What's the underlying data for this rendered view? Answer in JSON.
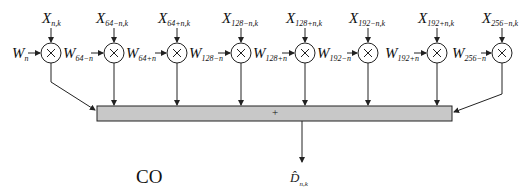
{
  "diagram": {
    "caption": "CO",
    "adder_symbol": "+",
    "output": {
      "base": "D̂",
      "sub": "n,k"
    },
    "initial_weight": {
      "base": "W",
      "sub": "n"
    },
    "multipliers": [
      {
        "x_label": {
          "base": "X",
          "sub": "n,k"
        },
        "w_out": {
          "base": "W",
          "sub": "64−n"
        }
      },
      {
        "x_label": {
          "base": "X",
          "sub": "64−n,k"
        },
        "w_out": {
          "base": "W",
          "sub": "64+n"
        }
      },
      {
        "x_label": {
          "base": "X",
          "sub": "64+n,k"
        },
        "w_out": {
          "base": "W",
          "sub": "128−n"
        }
      },
      {
        "x_label": {
          "base": "X",
          "sub": "128−n,k"
        },
        "w_out": {
          "base": "W",
          "sub": "128+n"
        }
      },
      {
        "x_label": {
          "base": "X",
          "sub": "128+n,k"
        },
        "w_out": {
          "base": "W",
          "sub": "192−n"
        }
      },
      {
        "x_label": {
          "base": "X",
          "sub": "192−n,k"
        },
        "w_out": {
          "base": "W",
          "sub": "192+n"
        }
      },
      {
        "x_label": {
          "base": "X",
          "sub": "192+n,k"
        },
        "w_out": {
          "base": "W",
          "sub": "256−n"
        }
      },
      {
        "x_label": {
          "base": "X",
          "sub": "256−n,k"
        },
        "w_out": null
      }
    ],
    "multiplier_symbol": "×",
    "colors": {
      "adder_fill": "#c8c8c8",
      "stroke": "#222222"
    }
  }
}
